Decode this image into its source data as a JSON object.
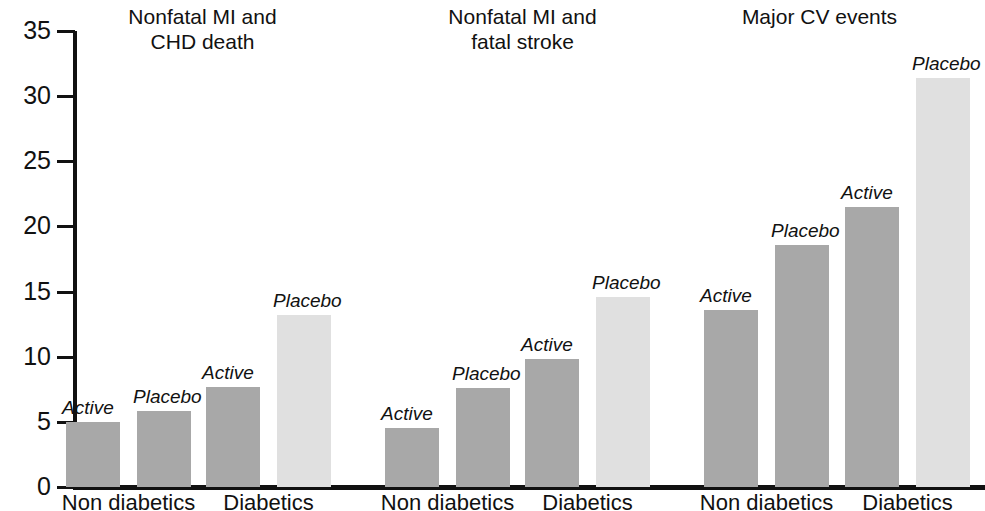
{
  "chart_data": {
    "type": "bar",
    "title": "",
    "xlabel": "",
    "ylabel": "",
    "ylim": [
      0,
      35
    ],
    "y_ticks": [
      0,
      5,
      10,
      15,
      20,
      25,
      30,
      35
    ],
    "grid": false,
    "legend_position": "none",
    "categories": [
      "Non diabetics",
      "Diabetics"
    ],
    "series": [
      {
        "name": "Active",
        "color": "#a8a8a8"
      },
      {
        "name": "Placebo",
        "color": "#a8a8a8"
      }
    ],
    "panels": [
      {
        "title": "Nonfatal MI and\nCHD death",
        "bars": [
          {
            "group": "Non diabetics",
            "label": "Active",
            "value": 5.0,
            "shade": "dark"
          },
          {
            "group": "Non diabetics",
            "label": "Placebo",
            "value": 5.8,
            "shade": "dark"
          },
          {
            "group": "Diabetics",
            "label": "Active",
            "value": 7.7,
            "shade": "dark"
          },
          {
            "group": "Diabetics",
            "label": "Placebo",
            "value": 13.2,
            "shade": "light"
          }
        ]
      },
      {
        "title": "Nonfatal MI and\nfatal stroke",
        "bars": [
          {
            "group": "Non diabetics",
            "label": "Active",
            "value": 4.5,
            "shade": "dark"
          },
          {
            "group": "Non diabetics",
            "label": "Placebo",
            "value": 7.6,
            "shade": "dark"
          },
          {
            "group": "Diabetics",
            "label": "Active",
            "value": 9.8,
            "shade": "dark"
          },
          {
            "group": "Diabetics",
            "label": "Placebo",
            "value": 14.6,
            "shade": "light"
          }
        ]
      },
      {
        "title": "Major CV events",
        "bars": [
          {
            "group": "Non diabetics",
            "label": "Active",
            "value": 13.6,
            "shade": "dark"
          },
          {
            "group": "Non diabetics",
            "label": "Placebo",
            "value": 18.6,
            "shade": "dark"
          },
          {
            "group": "Diabetics",
            "label": "Active",
            "value": 21.5,
            "shade": "dark"
          },
          {
            "group": "Diabetics",
            "label": "Placebo",
            "value": 31.4,
            "shade": "light"
          }
        ]
      }
    ],
    "colors": {
      "dark_bar": "#a8a8a8",
      "light_bar": "#e0e0e0",
      "axis": "#111111",
      "text": "#111111",
      "background": "#ffffff"
    }
  },
  "axis": {
    "tick_labels": [
      "0",
      "5",
      "10",
      "15",
      "20",
      "25",
      "30",
      "35"
    ]
  },
  "panel_titles": [
    "Nonfatal MI and\nCHD death",
    "Nonfatal MI and\nfatal stroke",
    "Major CV events"
  ],
  "x_group_labels": [
    "Non diabetics",
    "Diabetics",
    "Non diabetics",
    "Diabetics",
    "Non diabetics",
    "Diabetics"
  ]
}
